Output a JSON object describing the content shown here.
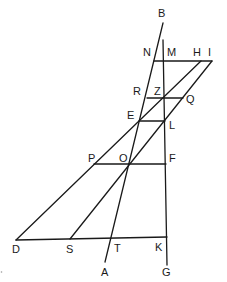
{
  "figure": {
    "type": "geometric-construction",
    "stroke_color": "#1a1a1a",
    "background": "#ffffff",
    "points": {
      "B": [
        163,
        23
      ],
      "M": [
        164,
        61
      ],
      "N": [
        154,
        61
      ],
      "H": [
        201,
        61
      ],
      "I": [
        212,
        61
      ],
      "R": [
        147,
        98
      ],
      "Z": [
        163,
        98
      ],
      "Q": [
        183,
        98
      ],
      "E": [
        139,
        121
      ],
      "L": [
        165,
        121
      ],
      "P": [
        94,
        164
      ],
      "O": [
        129,
        164
      ],
      "F": [
        166,
        164
      ],
      "D": [
        16,
        240
      ],
      "S": [
        70,
        239
      ],
      "T": [
        111,
        238
      ],
      "K": [
        167,
        237
      ],
      "A": [
        105,
        262
      ],
      "G": [
        167,
        265
      ]
    },
    "labels": [
      {
        "text": "B",
        "x": 158,
        "y": 17
      },
      {
        "text": "N",
        "x": 143,
        "y": 56
      },
      {
        "text": "M",
        "x": 167,
        "y": 56
      },
      {
        "text": "H",
        "x": 193,
        "y": 56
      },
      {
        "text": "I",
        "x": 208,
        "y": 56
      },
      {
        "text": "R",
        "x": 133,
        "y": 95
      },
      {
        "text": "Z",
        "x": 154,
        "y": 95
      },
      {
        "text": "Q",
        "x": 186,
        "y": 103
      },
      {
        "text": "E",
        "x": 127,
        "y": 119
      },
      {
        "text": "L",
        "x": 169,
        "y": 129
      },
      {
        "text": "P",
        "x": 88,
        "y": 162
      },
      {
        "text": "O",
        "x": 119,
        "y": 162
      },
      {
        "text": "F",
        "x": 169,
        "y": 162
      },
      {
        "text": "D",
        "x": 12,
        "y": 253
      },
      {
        "text": "S",
        "x": 66,
        "y": 253
      },
      {
        "text": "T",
        "x": 114,
        "y": 252
      },
      {
        "text": "K",
        "x": 155,
        "y": 251
      },
      {
        "text": "A",
        "x": 101,
        "y": 276
      },
      {
        "text": "G",
        "x": 162,
        "y": 276
      }
    ],
    "segments": [
      {
        "name": "line-BA",
        "from": "B",
        "to": "A"
      },
      {
        "name": "line-vertical-MG",
        "from": [
          163,
          40
        ],
        "to": "G"
      },
      {
        "name": "line-NI",
        "from": "N",
        "to": "I"
      },
      {
        "name": "line-RQ",
        "from": "R",
        "to": "Q"
      },
      {
        "name": "line-EL",
        "from": "E",
        "to": "L"
      },
      {
        "name": "line-PF",
        "from": "P",
        "to": "F"
      },
      {
        "name": "line-DK",
        "from": "D",
        "to": "K"
      },
      {
        "name": "line-DH",
        "from": "D",
        "to": "H"
      },
      {
        "name": "line-SI",
        "from": "S",
        "to": "I"
      }
    ]
  }
}
